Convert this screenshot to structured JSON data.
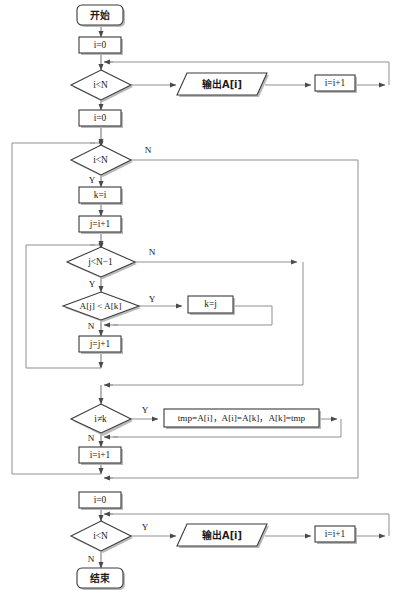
{
  "diagram": {
    "colors": {
      "shape_stroke": "#3a3a3a",
      "shape_fill": "#ffffff",
      "connector": "#8f8f8f",
      "shadow": "#b9b9b9",
      "text": "#1a1a1a",
      "background": "#ffffff"
    },
    "nodes": {
      "start": {
        "label": "开始",
        "type": "terminator"
      },
      "init_i_print1": {
        "label": "i=0",
        "type": "process"
      },
      "cond_print1": {
        "label": "i<N",
        "type": "decision"
      },
      "print1": {
        "label": "输出A[i]",
        "type": "io"
      },
      "inc_i_print1": {
        "label": "i=i+1",
        "type": "process"
      },
      "init_i_sort": {
        "label": "i=0",
        "type": "process"
      },
      "cond_outer": {
        "label": "i<N",
        "type": "decision"
      },
      "set_k": {
        "label": "k=i",
        "type": "process"
      },
      "init_j": {
        "label": "j=i+1",
        "type": "process"
      },
      "cond_inner": {
        "label": "j<N−1",
        "type": "decision"
      },
      "cond_compare": {
        "label": "A[j] < A[k]",
        "type": "decision"
      },
      "set_k_j": {
        "label": "k=j",
        "type": "process"
      },
      "inc_j": {
        "label": "j=j+1",
        "type": "process"
      },
      "cond_swap": {
        "label": "i≠k",
        "type": "decision"
      },
      "swap": {
        "label": "tmp=A[i]，A[i]=A[k]，A[k]=tmp",
        "type": "process"
      },
      "inc_i_sort": {
        "label": "i=i+1",
        "type": "process"
      },
      "init_i_print2": {
        "label": "i=0",
        "type": "process"
      },
      "cond_print2": {
        "label": "i<N",
        "type": "decision"
      },
      "print2": {
        "label": "输出A[i]",
        "type": "io"
      },
      "inc_i_print2": {
        "label": "i=i+1",
        "type": "process"
      },
      "end": {
        "label": "结束",
        "type": "terminator"
      }
    },
    "branch_labels": {
      "outer_no": "N",
      "outer_yes": "Y",
      "inner_no": "N",
      "inner_yes": "Y",
      "compare_yes": "Y",
      "compare_no": "N",
      "swap_yes": "Y",
      "swap_no": "N",
      "print2_yes": "Y",
      "print2_no": "N"
    }
  }
}
